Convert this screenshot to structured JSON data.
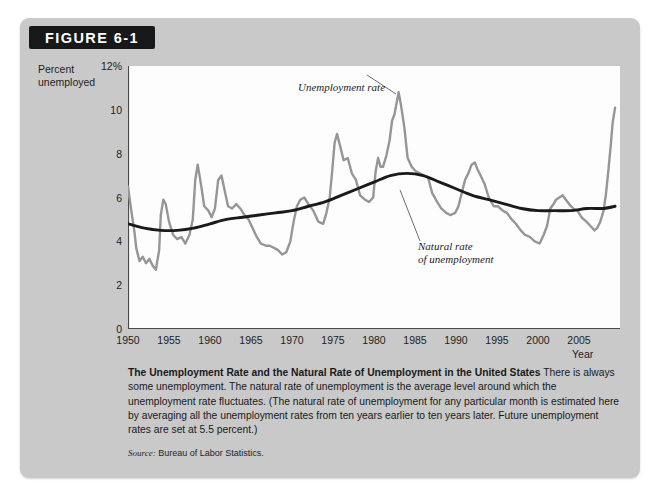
{
  "figure": {
    "badge_label": "FIGURE 6-1",
    "y_axis_title_line1": "Percent",
    "y_axis_title_line2": "unemployed",
    "x_axis_label": "Year",
    "bleed_text": "Unemployment"
  },
  "annotations": {
    "unemployment_rate": "Unemployment rate",
    "natural_rate_line1": "Natural rate",
    "natural_rate_line2": "of unemployment"
  },
  "caption": {
    "title": "The Unemployment Rate and the Natural Rate of Unemployment in the United States",
    "body": "There is always some unemployment. The natural rate of unemployment is the average level around which the unemployment rate fluctuates. (The natural rate of unemployment for any particular month is estimated here by averaging all the unemployment rates from ten years earlier to ten years later. Future unemployment rates are set at 5.5 percent.)",
    "source_label": "Source:",
    "source_text": "Bureau of Labor Statistics."
  },
  "colors": {
    "panel": "#c9c9c9",
    "badge": "#16181a",
    "plot_background": "#fdfdfd",
    "unemployment_rate_line": "#969696",
    "natural_rate_line": "#1a1a1a",
    "axis": "#4a4a4a"
  },
  "chart_data": {
    "type": "line",
    "title": "The Unemployment Rate and the Natural Rate of Unemployment in the United States",
    "xlabel": "Year",
    "ylabel": "Percent unemployed",
    "xlim": [
      1950,
      2010
    ],
    "ylim": [
      0,
      12
    ],
    "grid": false,
    "legend": "annotations-inline",
    "y_ticks_major": [
      0,
      2,
      4,
      6,
      8,
      10,
      12
    ],
    "y_tick_labels": [
      "0",
      "2",
      "4",
      "6",
      "8",
      "10",
      "12%"
    ],
    "y_ticks_minor": [
      1,
      3,
      5,
      7,
      9,
      11
    ],
    "x_ticks_major": [
      1950,
      1955,
      1960,
      1965,
      1970,
      1975,
      1980,
      1985,
      1990,
      1995,
      2000,
      2005
    ],
    "x_tick_labels": [
      "1950",
      "1955",
      "1960",
      "1965",
      "1970",
      "1975",
      "1980",
      "1985",
      "1990",
      "1995",
      "2000",
      "2005"
    ],
    "series": [
      {
        "name": "Unemployment rate",
        "color": "#969696",
        "x": [
          1950.0,
          1950.4,
          1950.8,
          1951.0,
          1951.4,
          1951.8,
          1952.2,
          1952.6,
          1953.0,
          1953.4,
          1953.8,
          1954.0,
          1954.3,
          1954.6,
          1955.0,
          1955.5,
          1956.0,
          1956.5,
          1957.0,
          1957.5,
          1957.9,
          1958.2,
          1958.5,
          1958.9,
          1959.3,
          1959.8,
          1960.2,
          1960.6,
          1961.0,
          1961.4,
          1961.8,
          1962.2,
          1962.7,
          1963.2,
          1963.7,
          1964.2,
          1964.7,
          1965.2,
          1965.7,
          1966.2,
          1966.8,
          1967.3,
          1967.8,
          1968.3,
          1968.8,
          1969.3,
          1969.8,
          1970.2,
          1970.6,
          1971.0,
          1971.5,
          1972.0,
          1972.6,
          1973.2,
          1973.8,
          1974.2,
          1974.6,
          1974.9,
          1975.2,
          1975.5,
          1975.9,
          1976.3,
          1976.8,
          1977.3,
          1977.8,
          1978.3,
          1978.9,
          1979.4,
          1979.9,
          1980.2,
          1980.5,
          1980.8,
          1981.1,
          1981.5,
          1981.9,
          1982.2,
          1982.5,
          1982.8,
          1983.0,
          1983.3,
          1983.7,
          1984.1,
          1984.6,
          1985.1,
          1985.6,
          1986.1,
          1986.6,
          1987.1,
          1987.7,
          1988.2,
          1988.8,
          1989.3,
          1989.9,
          1990.3,
          1990.7,
          1991.1,
          1991.5,
          1991.9,
          1992.3,
          1992.6,
          1993.0,
          1993.5,
          1994.0,
          1994.6,
          1995.1,
          1995.7,
          1996.2,
          1996.8,
          1997.3,
          1997.9,
          1998.4,
          1999.0,
          1999.6,
          2000.2,
          2000.7,
          2001.1,
          2001.5,
          2001.9,
          2002.2,
          2002.6,
          2003.0,
          2003.4,
          2003.8,
          2004.3,
          2004.8,
          2005.3,
          2005.9,
          2006.4,
          2006.9,
          2007.2,
          2007.6,
          2008.0,
          2008.3,
          2008.6,
          2008.9,
          2009.1,
          2009.4
        ],
        "y": [
          6.5,
          5.4,
          4.4,
          3.7,
          3.1,
          3.3,
          3.0,
          3.2,
          2.9,
          2.7,
          3.6,
          5.2,
          5.9,
          5.7,
          4.9,
          4.3,
          4.1,
          4.2,
          3.9,
          4.3,
          5.0,
          6.8,
          7.5,
          6.6,
          5.6,
          5.4,
          5.1,
          5.5,
          6.8,
          7.0,
          6.3,
          5.6,
          5.5,
          5.7,
          5.5,
          5.2,
          5.0,
          4.6,
          4.2,
          3.9,
          3.8,
          3.8,
          3.7,
          3.6,
          3.4,
          3.5,
          4.0,
          4.9,
          5.6,
          5.9,
          6.0,
          5.7,
          5.4,
          4.9,
          4.8,
          5.3,
          6.0,
          7.2,
          8.5,
          8.9,
          8.3,
          7.7,
          7.8,
          7.1,
          6.8,
          6.1,
          5.9,
          5.8,
          6.0,
          7.2,
          7.8,
          7.4,
          7.4,
          7.9,
          8.6,
          9.5,
          9.8,
          10.4,
          10.8,
          10.2,
          9.2,
          7.8,
          7.4,
          7.2,
          7.1,
          7.0,
          6.9,
          6.2,
          5.8,
          5.5,
          5.3,
          5.2,
          5.3,
          5.6,
          6.2,
          6.8,
          7.1,
          7.5,
          7.6,
          7.3,
          7.0,
          6.6,
          6.0,
          5.6,
          5.6,
          5.4,
          5.3,
          5.0,
          4.8,
          4.5,
          4.3,
          4.2,
          4.0,
          3.9,
          4.3,
          4.7,
          5.5,
          5.7,
          5.9,
          6.0,
          6.1,
          5.9,
          5.7,
          5.5,
          5.4,
          5.1,
          4.9,
          4.7,
          4.5,
          4.6,
          4.9,
          5.4,
          6.2,
          7.3,
          8.5,
          9.4,
          10.1
        ]
      },
      {
        "name": "Natural rate of unemployment",
        "color": "#1a1a1a",
        "x": [
          1950,
          1952,
          1954,
          1956,
          1958,
          1960,
          1962,
          1964,
          1966,
          1968,
          1970,
          1972,
          1974,
          1976,
          1978,
          1980,
          1982,
          1984,
          1986,
          1988,
          1990,
          1992,
          1994,
          1996,
          1998,
          2000,
          2002,
          2004,
          2006,
          2008,
          2009.4
        ],
        "y": [
          4.8,
          4.6,
          4.5,
          4.5,
          4.6,
          4.8,
          5.0,
          5.1,
          5.2,
          5.3,
          5.4,
          5.6,
          5.8,
          6.1,
          6.4,
          6.7,
          7.0,
          7.1,
          7.0,
          6.7,
          6.4,
          6.1,
          5.9,
          5.7,
          5.5,
          5.4,
          5.4,
          5.4,
          5.5,
          5.5,
          5.6
        ]
      }
    ],
    "notable_points": [
      {
        "label": "Korean War trough",
        "year": 1953,
        "value": 2.9
      },
      {
        "label": "1958 recession peak",
        "year": 1958.2,
        "value": 7.5
      },
      {
        "label": "late-1960s trough",
        "year": 1968.8,
        "value": 3.4
      },
      {
        "label": "1975 recession peak",
        "year": 1975.5,
        "value": 8.9
      },
      {
        "label": "1982-83 recession peak",
        "year": 1983.0,
        "value": 10.8
      },
      {
        "label": "2000 trough",
        "year": 2000.2,
        "value": 3.9
      },
      {
        "label": "2009 spike",
        "year": 2009.4,
        "value": 10.1
      }
    ]
  }
}
